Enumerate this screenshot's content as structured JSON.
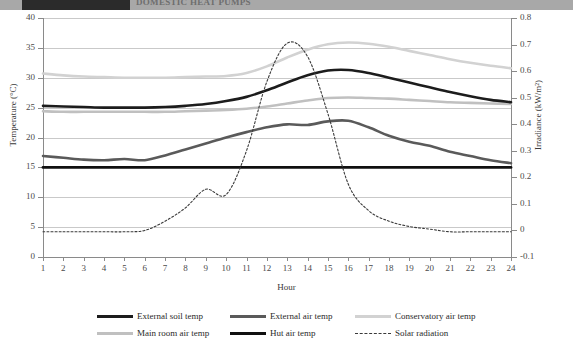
{
  "header": {
    "title": "DOMESTIC HEAT PUMPS"
  },
  "chart_data": {
    "type": "line",
    "title": "",
    "xlabel": "Hour",
    "ylabel": "Temperature (°C)",
    "y2label": "Irradiance (kW/m²)",
    "grid": true,
    "legend_position": "bottom",
    "xlim": [
      1,
      24
    ],
    "ylim": [
      0,
      40
    ],
    "y2lim": [
      -0.1,
      0.8
    ],
    "x": [
      1,
      2,
      3,
      4,
      5,
      6,
      7,
      8,
      9,
      10,
      11,
      12,
      13,
      14,
      15,
      16,
      17,
      18,
      19,
      20,
      21,
      22,
      23,
      24
    ],
    "xticks": [
      "1",
      "2",
      "3",
      "4",
      "5",
      "6",
      "7",
      "8",
      "9",
      "10",
      "11",
      "12",
      "13",
      "14",
      "15",
      "16",
      "17",
      "18",
      "19",
      "20",
      "21",
      "22",
      "23",
      "24"
    ],
    "yticks": [
      "0",
      "5",
      "10",
      "15",
      "20",
      "25",
      "30",
      "35",
      "40"
    ],
    "y2ticks": [
      "-0.1",
      "0",
      "0.1",
      "0.2",
      "0.3",
      "0.4",
      "0.5",
      "0.6",
      "0.7",
      "0.8"
    ],
    "series": [
      {
        "name": "External soil temp",
        "axis": "left",
        "color": "#1c1c1c",
        "width": 2.6,
        "dash": "none",
        "values": [
          25.3,
          25.2,
          25.1,
          25.0,
          25.0,
          25.0,
          25.1,
          25.3,
          25.6,
          26.1,
          26.8,
          27.9,
          29.2,
          30.4,
          31.2,
          31.3,
          30.8,
          30.0,
          29.2,
          28.4,
          27.6,
          26.9,
          26.3,
          25.9
        ]
      },
      {
        "name": "External air temp",
        "axis": "left",
        "color": "#5a5a5a",
        "width": 2.6,
        "dash": "none",
        "values": [
          16.9,
          16.6,
          16.3,
          16.2,
          16.4,
          16.2,
          17.0,
          18.0,
          19.0,
          20.0,
          20.9,
          21.7,
          22.2,
          22.1,
          22.7,
          22.8,
          21.7,
          20.3,
          19.3,
          18.6,
          17.6,
          16.9,
          16.2,
          15.7
        ]
      },
      {
        "name": "Conservatory air temp",
        "axis": "left",
        "color": "#d2d2d2",
        "width": 2.6,
        "dash": "none",
        "values": [
          30.7,
          30.4,
          30.2,
          30.1,
          30.0,
          30.0,
          30.0,
          30.1,
          30.2,
          30.3,
          30.8,
          31.9,
          33.4,
          34.7,
          35.6,
          35.9,
          35.7,
          35.2,
          34.5,
          33.8,
          33.1,
          32.5,
          32.0,
          31.6
        ]
      },
      {
        "name": "Main room air temp",
        "axis": "left",
        "color": "#c0c0c0",
        "width": 2.6,
        "dash": "none",
        "values": [
          24.4,
          24.3,
          24.3,
          24.3,
          24.3,
          24.3,
          24.3,
          24.4,
          24.5,
          24.6,
          24.8,
          25.2,
          25.7,
          26.2,
          26.6,
          26.7,
          26.6,
          26.5,
          26.3,
          26.1,
          25.9,
          25.8,
          25.7,
          25.6
        ]
      },
      {
        "name": "Hut air temp",
        "axis": "left",
        "color": "#101010",
        "width": 2.8,
        "dash": "none",
        "values": [
          15.0,
          15.0,
          15.0,
          15.0,
          15.0,
          15.0,
          15.0,
          15.0,
          15.0,
          15.0,
          15.0,
          15.0,
          15.0,
          15.0,
          15.0,
          15.0,
          15.0,
          15.0,
          15.0,
          15.0,
          15.0,
          15.0,
          15.0,
          15.0
        ]
      },
      {
        "name": "Solar radiation",
        "axis": "right",
        "color": "#3a3a3a",
        "width": 1.1,
        "dash": "2,2",
        "values": [
          -0.005,
          -0.005,
          -0.005,
          -0.005,
          -0.005,
          0.0,
          0.035,
          0.085,
          0.155,
          0.135,
          0.3,
          0.56,
          0.705,
          0.655,
          0.44,
          0.175,
          0.075,
          0.035,
          0.015,
          0.005,
          -0.005,
          -0.005,
          -0.005,
          -0.005
        ]
      }
    ]
  },
  "legend": {
    "rows": [
      [
        {
          "label": "External soil temp",
          "color": "#1c1c1c",
          "width": 3,
          "dash": "solid"
        },
        {
          "label": "External air temp",
          "color": "#5a5a5a",
          "width": 3,
          "dash": "solid"
        },
        {
          "label": "Conservatory air temp",
          "color": "#d2d2d2",
          "width": 3,
          "dash": "solid"
        }
      ],
      [
        {
          "label": "Main room air temp",
          "color": "#c0c0c0",
          "width": 3,
          "dash": "solid"
        },
        {
          "label": "Hut air temp",
          "color": "#101010",
          "width": 3,
          "dash": "solid"
        },
        {
          "label": "Solar radiation",
          "color": "#3a3a3a",
          "width": 1,
          "dash": "dotted"
        }
      ]
    ]
  }
}
